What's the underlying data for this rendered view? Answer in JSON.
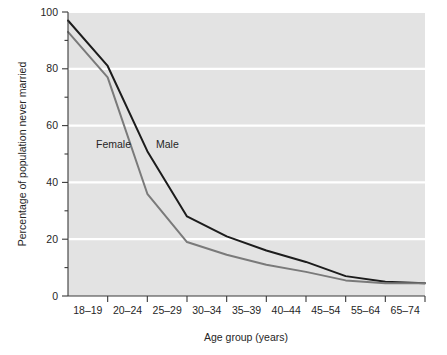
{
  "chart_data": {
    "type": "line",
    "title": "",
    "subtitle": "",
    "xlabel": "Age group (years)",
    "ylabel": "Percentage of population never married",
    "categories": [
      "",
      "18–19",
      "20–24",
      "25–29",
      "30–34",
      "35–39",
      "40–44",
      "45–54",
      "55–64",
      "65–74"
    ],
    "xtick_labels": [
      "18–19",
      "20–24",
      "25–29",
      "30–34",
      "35–39",
      "40–44",
      "45–54",
      "55–64",
      "65–74"
    ],
    "ylim": [
      0,
      100
    ],
    "xlim": [
      0,
      9
    ],
    "ytick_values": [
      0,
      20,
      40,
      60,
      80,
      100
    ],
    "ytick_labels": [
      "0",
      "20",
      "40",
      "60",
      "80",
      "100"
    ],
    "yminor_tick_values": [
      10,
      30,
      50,
      70,
      90
    ],
    "grid": "horizontal-major-white",
    "legend": "inline-labels",
    "series": [
      {
        "name": "Male",
        "color": "#1c1c1c",
        "values": [
          97,
          81,
          51,
          28,
          21,
          16,
          12,
          7,
          5,
          4.5
        ]
      },
      {
        "name": "Female",
        "color": "#7a7a7a",
        "values": [
          93,
          77,
          36,
          19,
          14.5,
          11,
          8.5,
          5.5,
          4.5,
          4.5
        ]
      }
    ],
    "annotations": [
      {
        "text": "Female",
        "x_px": 96,
        "y_px": 148
      },
      {
        "text": "Male",
        "x_px": 156,
        "y_px": 148
      }
    ]
  },
  "style": {
    "plot_background": "#e3e3e3",
    "page_background": "#ffffff",
    "gridline_color": "#ffffff",
    "axis_color": "#3a3a3a",
    "male_color": "#1c1c1c",
    "female_color": "#7a7a7a"
  }
}
